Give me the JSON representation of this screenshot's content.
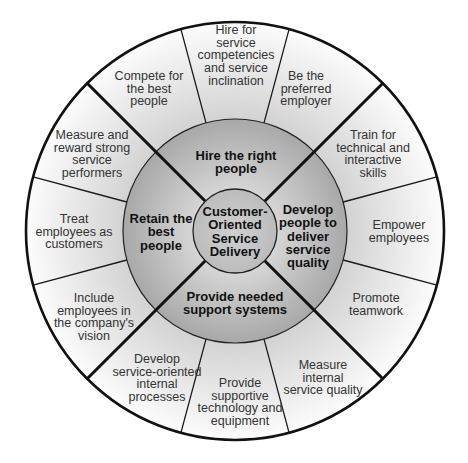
{
  "colors": {
    "outer_ring_inner": "#d4d4d4",
    "outer_ring_outer": "#fbfbfb",
    "middle_ring_inner": "#a9a9a9",
    "middle_ring_outer": "#cfcfcf",
    "core_fill": "#c4c4c4",
    "line": "#111111"
  },
  "core": {
    "lines": [
      "Customer-",
      "Oriented",
      "Service",
      "Delivery"
    ]
  },
  "strategies": [
    {
      "name": "hire",
      "lines": [
        "Hire the right",
        "people"
      ]
    },
    {
      "name": "retain",
      "lines": [
        "Retain the",
        "best",
        "people"
      ]
    },
    {
      "name": "develop",
      "lines": [
        "Develop",
        "people to",
        "deliver",
        "service",
        "quality"
      ]
    },
    {
      "name": "support",
      "lines": [
        "Provide needed",
        "support systems"
      ]
    }
  ],
  "outer_segments": [
    {
      "name": "hire-for-competencies",
      "lines": [
        "Hire for",
        "service",
        "competencies",
        "and service",
        "inclination"
      ]
    },
    {
      "name": "compete-best-people",
      "lines": [
        "Compete for",
        "the best",
        "people"
      ]
    },
    {
      "name": "preferred-employer",
      "lines": [
        "Be the",
        "preferred",
        "employer"
      ]
    },
    {
      "name": "measure-reward",
      "lines": [
        "Measure and",
        "reward strong",
        "service",
        "performers"
      ]
    },
    {
      "name": "train-skills",
      "lines": [
        "Train for",
        "technical and",
        "interactive",
        "skills"
      ]
    },
    {
      "name": "treat-as-customers",
      "lines": [
        "Treat",
        "employees as",
        "customers"
      ]
    },
    {
      "name": "empower-employees",
      "lines": [
        "Empower",
        "employees"
      ]
    },
    {
      "name": "include-in-vision",
      "lines": [
        "Include",
        "employees in",
        "the company's",
        "vision"
      ]
    },
    {
      "name": "promote-teamwork",
      "lines": [
        "Promote",
        "teamwork"
      ]
    },
    {
      "name": "internal-processes",
      "lines": [
        "Develop",
        "service-oriented",
        "internal",
        "processes"
      ]
    },
    {
      "name": "supportive-technology",
      "lines": [
        "Provide",
        "supportive",
        "technology and",
        "equipment"
      ]
    },
    {
      "name": "measure-internal-quality",
      "lines": [
        "Measure",
        "internal",
        "service quality"
      ]
    }
  ]
}
